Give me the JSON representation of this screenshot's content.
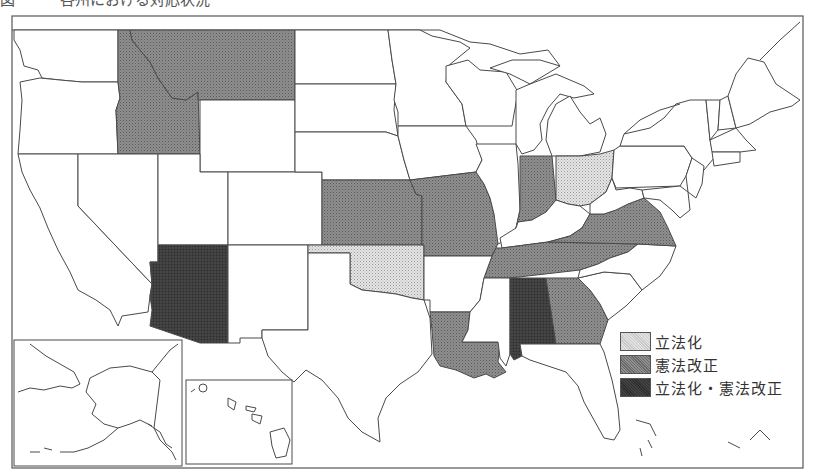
{
  "title": "図　　　各州における対応状況",
  "legend": {
    "items": [
      {
        "key": "legislation",
        "label": "立法化",
        "pattern": "light"
      },
      {
        "key": "constitutional_amendment",
        "label": "憲法改正",
        "pattern": "medium"
      },
      {
        "key": "both",
        "label": "立法化・憲法改正",
        "pattern": "dark"
      }
    ]
  },
  "colors": {
    "light": "#d6d6d6",
    "medium": "#8a8a8a",
    "dark": "#3c3c3c",
    "none": "#ffffff",
    "line": "#4a4a4a"
  },
  "states": {
    "legislation": [
      "Ohio",
      "Oklahoma"
    ],
    "constitutional_amendment": [
      "Idaho",
      "Montana",
      "Kansas",
      "Missouri",
      "Indiana",
      "Virginia",
      "Tennessee",
      "Louisiana",
      "Georgia"
    ],
    "both": [
      "Arizona",
      "Alabama"
    ]
  },
  "insets": [
    "Alaska",
    "Hawaii"
  ]
}
